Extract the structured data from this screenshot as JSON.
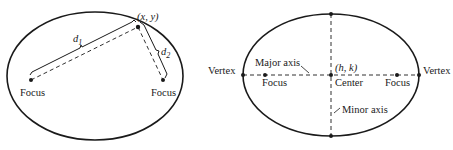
{
  "left_diagram": {
    "title": "Ellipse definition: sum of distances to foci",
    "point_label": "(x, y)",
    "d1_label": "d",
    "d1_sub": "1",
    "d2_label": "d",
    "d2_sub": "2",
    "focus_left_label": "Focus",
    "focus_right_label": "Focus"
  },
  "right_diagram": {
    "title": "Parts of an ellipse",
    "vertex_left_label": "Vertex",
    "vertex_right_label": "Vertex",
    "major_axis_label": "Major axis",
    "minor_axis_label": "Minor axis",
    "center_coord_label": "(h, k)",
    "center_label": "Center",
    "focus_left_label": "Focus",
    "focus_right_label": "Focus"
  },
  "colors": {
    "stroke": "#1a1a1a",
    "background": "#ffffff"
  }
}
